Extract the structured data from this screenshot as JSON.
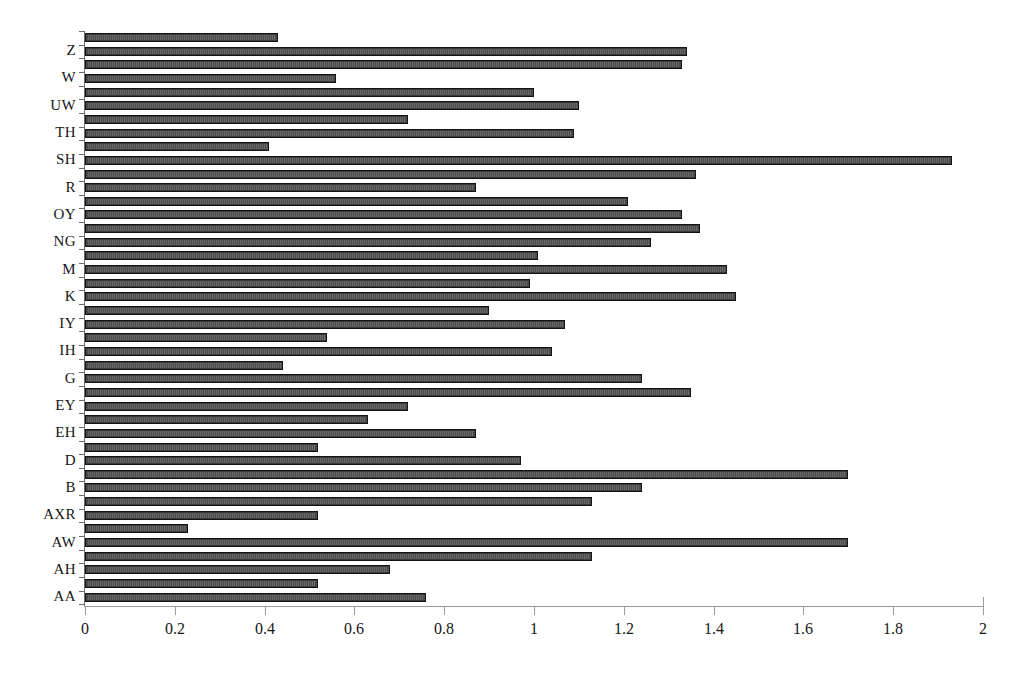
{
  "chart_data": {
    "type": "bar",
    "orientation": "horizontal",
    "title": "",
    "xlabel": "",
    "ylabel": "",
    "xlim": [
      0,
      2
    ],
    "ylim": [
      0,
      41
    ],
    "grid": false,
    "legend": null,
    "x_ticks": [
      "0",
      "0.2",
      "0.4",
      "0.6",
      "0.8",
      "1",
      "1.2",
      "1.4",
      "1.6",
      "1.8",
      "2"
    ],
    "x_tick_values": [
      0,
      0.2,
      0.4,
      0.6,
      0.8,
      1.0,
      1.2,
      1.4,
      1.6,
      1.8,
      2.0
    ],
    "categories": [
      "Z",
      "W",
      "UW",
      "TH",
      "SH",
      "R",
      "OY",
      "NG",
      "M",
      "K",
      "IY",
      "IH",
      "G",
      "EY",
      "EH",
      "D",
      "B",
      "AXR",
      "AW",
      "AH",
      "AA"
    ],
    "bars_top_to_bottom": [
      {
        "index": 1,
        "label": "Z",
        "value": 0.43
      },
      {
        "index": 2,
        "label": "Z",
        "value": 1.34
      },
      {
        "index": 3,
        "label": "Z",
        "value": 1.33
      },
      {
        "index": 4,
        "label": "W",
        "value": 0.56
      },
      {
        "index": 5,
        "label": "W",
        "value": 1.0
      },
      {
        "index": 6,
        "label": "UW",
        "value": 1.1
      },
      {
        "index": 7,
        "label": "UW",
        "value": 0.72
      },
      {
        "index": 8,
        "label": "TH",
        "value": 1.09
      },
      {
        "index": 9,
        "label": "TH",
        "value": 0.41
      },
      {
        "index": 10,
        "label": "SH",
        "value": 1.93
      },
      {
        "index": 11,
        "label": "SH",
        "value": 1.36
      },
      {
        "index": 12,
        "label": "R",
        "value": 0.87
      },
      {
        "index": 13,
        "label": "R",
        "value": 1.21
      },
      {
        "index": 14,
        "label": "OY",
        "value": 1.33
      },
      {
        "index": 15,
        "label": "OY",
        "value": 1.37
      },
      {
        "index": 16,
        "label": "NG",
        "value": 1.26
      },
      {
        "index": 17,
        "label": "NG",
        "value": 1.01
      },
      {
        "index": 18,
        "label": "M",
        "value": 1.43
      },
      {
        "index": 19,
        "label": "M",
        "value": 0.99
      },
      {
        "index": 20,
        "label": "K",
        "value": 1.45
      },
      {
        "index": 21,
        "label": "K",
        "value": 0.9
      },
      {
        "index": 22,
        "label": "IY",
        "value": 1.07
      },
      {
        "index": 23,
        "label": "IY",
        "value": 0.54
      },
      {
        "index": 24,
        "label": "IH",
        "value": 1.04
      },
      {
        "index": 25,
        "label": "IH",
        "value": 0.44
      },
      {
        "index": 26,
        "label": "G",
        "value": 1.24
      },
      {
        "index": 27,
        "label": "G",
        "value": 1.35
      },
      {
        "index": 28,
        "label": "EY",
        "value": 0.72
      },
      {
        "index": 29,
        "label": "EY",
        "value": 0.63
      },
      {
        "index": 30,
        "label": "EH",
        "value": 0.87
      },
      {
        "index": 31,
        "label": "EH",
        "value": 0.52
      },
      {
        "index": 32,
        "label": "D",
        "value": 0.97
      },
      {
        "index": 33,
        "label": "D",
        "value": 1.7
      },
      {
        "index": 34,
        "label": "B",
        "value": 1.24
      },
      {
        "index": 35,
        "label": "B",
        "value": 1.13
      },
      {
        "index": 36,
        "label": "AXR",
        "value": 0.52
      },
      {
        "index": 37,
        "label": "AXR",
        "value": 0.23
      },
      {
        "index": 38,
        "label": "AW",
        "value": 1.7
      },
      {
        "index": 39,
        "label": "AW",
        "value": 1.13
      },
      {
        "index": 40,
        "label": "AH",
        "value": 0.68
      },
      {
        "index": 41,
        "label": "AH",
        "value": 0.52
      },
      {
        "index": 42,
        "label": "AA",
        "value": 0.76
      }
    ],
    "colors": {
      "bar_fill": "#4a4a4a",
      "bar_edge": "#141414",
      "axis": "#6d6d6d",
      "background": "#ffffff",
      "text": "#161616"
    }
  },
  "axis": {
    "x_min_label": "0",
    "x_max_label": "2"
  }
}
